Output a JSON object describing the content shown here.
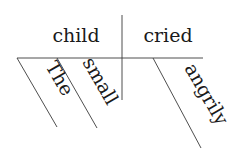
{
  "diagram": {
    "type": "sentence-diagram",
    "sentence": "The small child cried angrily",
    "subject": "child",
    "predicate": "cried",
    "subject_modifiers": [
      "The",
      "small"
    ],
    "predicate_modifiers": [
      "angrily"
    ],
    "colors": {
      "text": "#1a1a1a",
      "lines": "#3a3a3a",
      "background": "#ffffff"
    }
  }
}
